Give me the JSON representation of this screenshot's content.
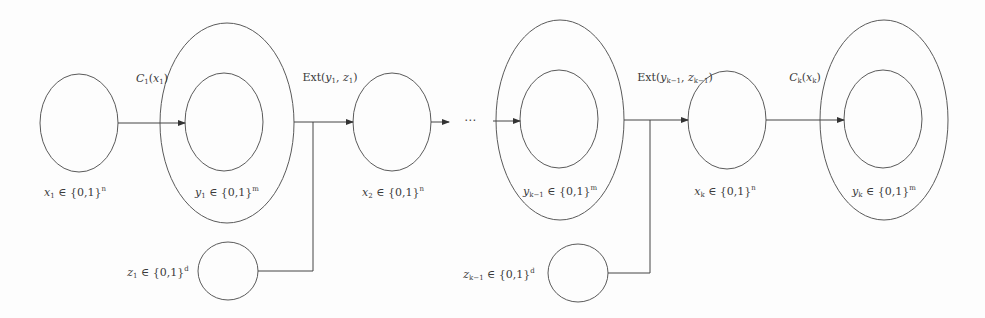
{
  "diagram": {
    "type": "flow",
    "title": "",
    "stroke_color": "#5a5a5a",
    "background": "#fdfdfd",
    "nodes": [
      {
        "id": "x1",
        "shape": "ellipse",
        "label_var": "x",
        "label_sub": "1",
        "label_set": "{0,1}",
        "label_sup": "n"
      },
      {
        "id": "y1",
        "shape": "nested-ellipse",
        "label_var": "y",
        "label_sub": "1",
        "label_set": "{0,1}",
        "label_sup": "m"
      },
      {
        "id": "z1",
        "shape": "ellipse",
        "label_var": "z",
        "label_sub": "1",
        "label_set": "{0,1}",
        "label_sup": "d"
      },
      {
        "id": "x2",
        "shape": "ellipse",
        "label_var": "x",
        "label_sub": "2",
        "label_set": "{0,1}",
        "label_sup": "n"
      },
      {
        "id": "ykm1",
        "shape": "nested-ellipse",
        "label_var": "y",
        "label_sub": "k−1",
        "label_set": "{0,1}",
        "label_sup": "m"
      },
      {
        "id": "zkm1",
        "shape": "ellipse",
        "label_var": "z",
        "label_sub": "k−1",
        "label_set": "{0,1}",
        "label_sup": "d"
      },
      {
        "id": "xk",
        "shape": "ellipse",
        "label_var": "x",
        "label_sub": "k",
        "label_set": "{0,1}",
        "label_sup": "n"
      },
      {
        "id": "yk",
        "shape": "nested-ellipse",
        "label_var": "y",
        "label_sub": "k",
        "label_set": "{0,1}",
        "label_sup": "m"
      }
    ],
    "edges": [
      {
        "from": "x1",
        "to": "y1",
        "label_fn": "C",
        "label_fn_sub": "1",
        "label_arg": "x",
        "label_arg_sub": "1"
      },
      {
        "from": "y1,z1",
        "to": "x2",
        "label_fn": "Ext",
        "label_a": "y",
        "label_a_sub": "1",
        "label_b": "z",
        "label_b_sub": "1"
      },
      {
        "from": "x2",
        "to": "ellipsis",
        "label": ""
      },
      {
        "from": "ellipsis",
        "to": "ykm1",
        "label": ""
      },
      {
        "from": "ykm1,zkm1",
        "to": "xk",
        "label_fn": "Ext",
        "label_a": "y",
        "label_a_sub": "k−1",
        "label_b": "z",
        "label_b_sub": "k−1"
      },
      {
        "from": "xk",
        "to": "yk",
        "label_fn": "C",
        "label_fn_sub": "k",
        "label_arg": "x",
        "label_arg_sub": "k"
      }
    ],
    "ellipsis": "⋯",
    "element_of": "∈"
  }
}
